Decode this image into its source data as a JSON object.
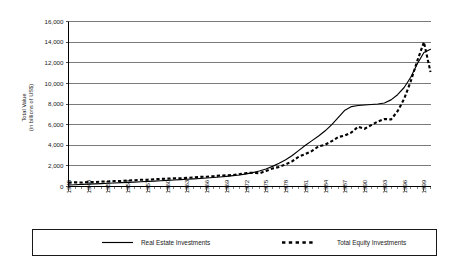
{
  "chart_data": {
    "type": "line",
    "title": "",
    "xlabel": "",
    "ylabel": "Total Value (in billions of US$)",
    "ylabel_lines": [
      "Total Value",
      "(in billions of US$)"
    ],
    "ylim": [
      0,
      16000
    ],
    "xlim": [
      1945,
      2000
    ],
    "grid": true,
    "legend_position": "bottom",
    "ytick_labels": [
      "0",
      "2,000",
      "4,000",
      "6,000",
      "8,000",
      "10,000",
      "12,000",
      "14,000",
      "16,000"
    ],
    "ytick_values": [
      0,
      2000,
      4000,
      6000,
      8000,
      10000,
      12000,
      14000,
      16000
    ],
    "xtick_labels": [
      "1945",
      "1948",
      "1951",
      "1954",
      "1957",
      "1960",
      "1963",
      "1966",
      "1969",
      "1972",
      "1975",
      "1978",
      "1981",
      "1984",
      "1987",
      "1990",
      "1993",
      "1996",
      "1999"
    ],
    "xtick_values": [
      1945,
      1948,
      1951,
      1954,
      1957,
      1960,
      1963,
      1966,
      1969,
      1972,
      1975,
      1978,
      1981,
      1984,
      1987,
      1990,
      1993,
      1996,
      1999
    ],
    "x": [
      1945,
      1946,
      1947,
      1948,
      1949,
      1950,
      1951,
      1952,
      1953,
      1954,
      1955,
      1956,
      1957,
      1958,
      1959,
      1960,
      1961,
      1962,
      1963,
      1964,
      1965,
      1966,
      1967,
      1968,
      1969,
      1970,
      1971,
      1972,
      1973,
      1974,
      1975,
      1976,
      1977,
      1978,
      1979,
      1980,
      1981,
      1982,
      1983,
      1984,
      1985,
      1986,
      1987,
      1988,
      1989,
      1990,
      1991,
      1992,
      1993,
      1994,
      1995,
      1996,
      1997,
      1998,
      1999,
      2000
    ],
    "series": [
      {
        "name": "Real Estate Investments",
        "style": "solid",
        "values": [
          150,
          175,
          200,
          225,
          250,
          280,
          310,
          340,
          370,
          400,
          430,
          465,
          495,
          525,
          560,
          600,
          630,
          665,
          700,
          740,
          780,
          820,
          870,
          920,
          980,
          1050,
          1120,
          1220,
          1350,
          1500,
          1700,
          1950,
          2250,
          2600,
          3000,
          3500,
          4000,
          4450,
          4900,
          5400,
          6000,
          6700,
          7400,
          7750,
          7850,
          7900,
          7950,
          8000,
          8100,
          8400,
          8900,
          9600,
          10600,
          11900,
          13000,
          13300
        ]
      },
      {
        "name": "Total Equity Investments",
        "style": "dashed",
        "values": [
          380,
          400,
          390,
          420,
          430,
          470,
          490,
          520,
          540,
          580,
          610,
          650,
          660,
          700,
          740,
          760,
          790,
          800,
          840,
          880,
          930,
          950,
          1000,
          1060,
          1080,
          1120,
          1200,
          1300,
          1340,
          1280,
          1500,
          1750,
          1900,
          2150,
          2450,
          2900,
          3150,
          3450,
          3900,
          4050,
          4400,
          4800,
          4950,
          5250,
          5800,
          5600,
          5950,
          6300,
          6550,
          6500,
          7300,
          8500,
          10200,
          12200,
          14000,
          11100
        ]
      }
    ]
  },
  "legend": {
    "items": [
      {
        "label": "Real Estate Investments",
        "style": "solid"
      },
      {
        "label": "Total Equity Investments",
        "style": "dashed"
      }
    ]
  }
}
